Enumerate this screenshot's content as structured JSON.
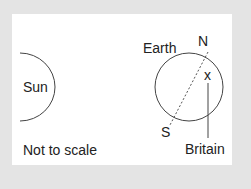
{
  "labels": {
    "sun": "Sun",
    "earth": "Earth",
    "north": "N",
    "south": "S",
    "marker": "x",
    "britain": "Britain",
    "scale_note": "Not to scale"
  },
  "colors": {
    "background": "#e4e4e4",
    "panel": "#ffffff",
    "stroke": "#444444",
    "text": "#222222"
  }
}
